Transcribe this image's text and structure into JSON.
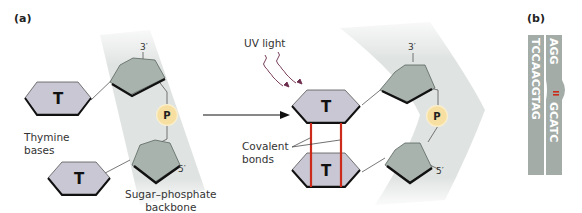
{
  "figure": {
    "panel_a": {
      "label": "(a)",
      "before": {
        "base_top": "T",
        "base_bottom": "T",
        "phosphate": "P",
        "prime_top": "3′",
        "prime_bottom": "5′",
        "thymine_label_line1": "Thymine",
        "thymine_label_line2": "bases",
        "backbone_label_line1": "Sugar–phosphate",
        "backbone_label_line2": "backbone"
      },
      "uv_label": "UV light",
      "after": {
        "base_top": "T",
        "base_bottom": "T",
        "phosphate": "P",
        "prime_top": "3′",
        "prime_bottom": "5′",
        "covalent_label_line1": "Covalent",
        "covalent_label_line2": "bonds"
      }
    },
    "panel_b": {
      "label": "(b)",
      "strand_left": "TCCAACGTAG",
      "strand_right_top": "AGG",
      "strand_right_bottom": "GCATC"
    },
    "colors": {
      "backbone_band": "#dfe3e1",
      "base_fill": "#c9c7d3",
      "sugar_fill": "#a9b3ae",
      "phosphate_fill": "#f6dfa0",
      "bond_red": "#cc2a1a",
      "uv_arrow": "#6a2a4a",
      "strand_gray": "#9aa39f"
    }
  }
}
